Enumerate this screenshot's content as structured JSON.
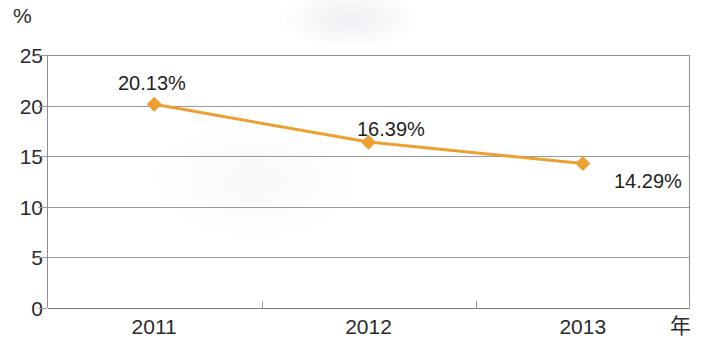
{
  "chart_data": {
    "type": "line",
    "title": "",
    "xlabel": "年",
    "ylabel": "%",
    "categories": [
      "2011",
      "2012",
      "2013"
    ],
    "series": [
      {
        "name": "",
        "values": [
          20.13,
          16.39,
          14.29
        ],
        "point_labels": [
          "20.13%",
          "16.39%",
          "14.29%"
        ],
        "color": "#ED9F31",
        "marker": "diamond"
      }
    ],
    "ylim": [
      0,
      25
    ],
    "yticks": [
      0,
      5,
      10,
      15,
      20,
      25
    ],
    "ytick_labels": [
      "0",
      "5",
      "10",
      "15",
      "20",
      "25"
    ],
    "grid": true,
    "legend": false,
    "legend_position": "none"
  },
  "axes": {
    "y_unit_label": "%",
    "x_unit_label": "年",
    "y_ticks": [
      {
        "label": "25",
        "value": 25
      },
      {
        "label": "20",
        "value": 20
      },
      {
        "label": "15",
        "value": 15
      },
      {
        "label": "10",
        "value": 10
      },
      {
        "label": "5",
        "value": 5
      },
      {
        "label": "0",
        "value": 0
      }
    ],
    "x_ticks": [
      {
        "label": "2011"
      },
      {
        "label": "2012"
      },
      {
        "label": "2013"
      }
    ]
  },
  "points": [
    {
      "category": "2011",
      "value": 20.13,
      "label": "20.13%"
    },
    {
      "category": "2012",
      "value": 16.39,
      "label": "16.39%"
    },
    {
      "category": "2013",
      "value": 14.29,
      "label": "14.29%"
    }
  ],
  "colors": {
    "series": "#ED9F31",
    "grid": "#9a9a9a",
    "axis": "#8e8e8e",
    "text": "#2b2b2b",
    "background": "#ffffff"
  }
}
